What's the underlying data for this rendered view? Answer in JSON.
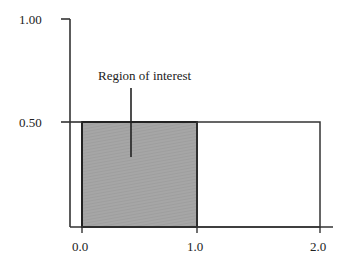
{
  "diagram": {
    "type": "region-diagram",
    "annotation": "Region of interest",
    "y_axis": {
      "ticks": [
        {
          "value": 1.0,
          "label": "1.00"
        },
        {
          "value": 0.5,
          "label": "0.50"
        }
      ]
    },
    "x_axis": {
      "ticks": [
        {
          "value": 0.0,
          "label": "0.0"
        },
        {
          "value": 1.0,
          "label": "1.0"
        },
        {
          "value": 2.0,
          "label": "2.0"
        }
      ]
    },
    "regions": [
      {
        "name": "shaded-region",
        "x": [
          0.0,
          1.0
        ],
        "y": [
          0.0,
          0.5
        ],
        "fill": "#a3a3a3"
      },
      {
        "name": "unshaded-region",
        "x": [
          1.0,
          2.0
        ],
        "y": [
          0.0,
          0.5
        ],
        "fill": "#ffffff"
      }
    ],
    "colors": {
      "stroke": "#222222",
      "shade": "#a3a3a3",
      "background": "#ffffff"
    }
  }
}
